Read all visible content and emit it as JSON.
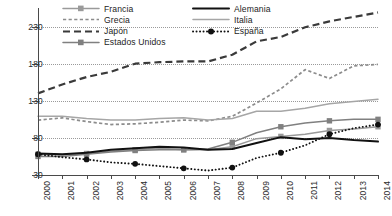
{
  "chart_data": {
    "type": "line",
    "title": "",
    "subtitle": "",
    "xlabel": "",
    "ylabel": "",
    "x": [
      2000,
      2001,
      2002,
      2003,
      2004,
      2005,
      2006,
      2007,
      2008,
      2009,
      2010,
      2011,
      2012,
      2013,
      2014
    ],
    "xtick_labels": [
      "2000",
      "2001",
      "2002",
      "2003",
      "2004",
      "2005",
      "2006",
      "2007",
      "2008",
      "2009",
      "2010",
      "2011",
      "2012",
      "2013",
      "2014"
    ],
    "ytick_labels": [
      "30",
      "80",
      "130",
      "180",
      "230"
    ],
    "yticks": [
      30,
      80,
      130,
      180,
      230
    ],
    "ylim": [
      30,
      255
    ],
    "xlim": [
      2000,
      2014
    ],
    "grid": "horizontal-dotted",
    "legend_position": "top-inside",
    "series": [
      {
        "name": "Francia",
        "color": "#9a9a9a",
        "style": "solid-marker",
        "marker": "square",
        "values": [
          58,
          57,
          59,
          62,
          64,
          66,
          64,
          64,
          68,
          79,
          82,
          85,
          90,
          92,
          95
        ]
      },
      {
        "name": "Grecia",
        "color": "#8c8c8c",
        "style": "dashed-fine",
        "marker": "none",
        "values": [
          104,
          107,
          102,
          98,
          99,
          101,
          104,
          103,
          109,
          127,
          146,
          172,
          160,
          177,
          179
        ]
      },
      {
        "name": "Japón",
        "color": "#3a3a3a",
        "style": "long-dash",
        "marker": "none",
        "values": [
          140,
          152,
          162,
          169,
          180,
          182,
          183,
          183,
          192,
          210,
          216,
          229,
          237,
          243,
          249
        ]
      },
      {
        "name": "Estados Unidos",
        "color": "#808080",
        "style": "solid-marker",
        "marker": "square",
        "values": [
          55,
          55,
          58,
          61,
          63,
          64,
          64,
          65,
          74,
          87,
          95,
          100,
          103,
          105,
          105
        ]
      },
      {
        "name": "Alemania",
        "color": "#111111",
        "style": "solid-thick",
        "marker": "none",
        "values": [
          59,
          58,
          60,
          64,
          66,
          68,
          67,
          64,
          65,
          73,
          81,
          78,
          80,
          77,
          75
        ]
      },
      {
        "name": "Italia",
        "color": "#a6a6a6",
        "style": "solid-thin",
        "marker": "none",
        "values": [
          109,
          109,
          106,
          104,
          104,
          106,
          107,
          104,
          106,
          116,
          116,
          120,
          126,
          129,
          132
        ]
      },
      {
        "name": "España",
        "color": "#111111",
        "style": "dotted-marker",
        "marker": "circle",
        "values": [
          58,
          54,
          51,
          47,
          45,
          42,
          39,
          36,
          40,
          53,
          60,
          70,
          85,
          93,
          98
        ]
      }
    ]
  },
  "legend": {
    "items": [
      {
        "label": "Francia",
        "series": 0,
        "col": 0,
        "row": 0
      },
      {
        "label": "Alemania",
        "series": 4,
        "col": 1,
        "row": 0
      },
      {
        "label": "Grecia",
        "series": 1,
        "col": 0,
        "row": 1
      },
      {
        "label": "Italia",
        "series": 5,
        "col": 1,
        "row": 1
      },
      {
        "label": "Japón",
        "series": 2,
        "col": 0,
        "row": 2
      },
      {
        "label": "España",
        "series": 6,
        "col": 1,
        "row": 2
      },
      {
        "label": "Estados Unidos",
        "series": 3,
        "col": 0,
        "row": 3
      }
    ]
  },
  "colors": {
    "axis": "#4a4a4a",
    "grid": "#9a9a9a",
    "text": "#1d1d1d",
    "background": "#ffffff"
  }
}
